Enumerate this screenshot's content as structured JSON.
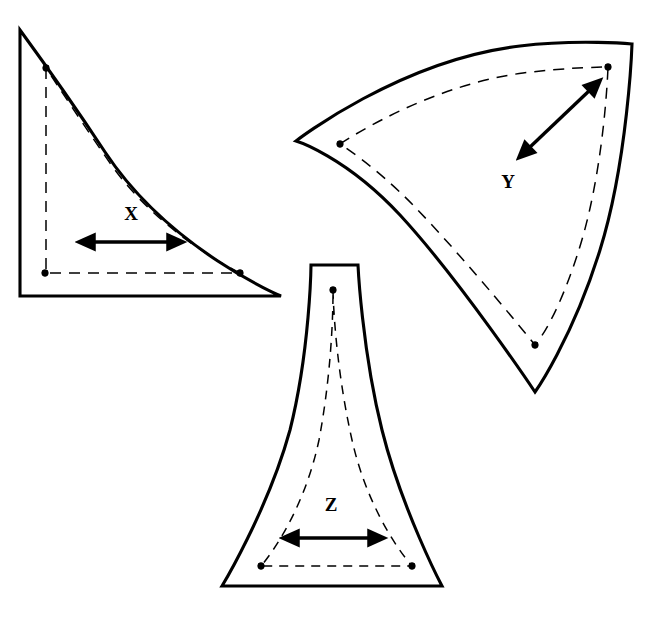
{
  "diagram": {
    "background_color": "#ffffff",
    "line_color": "#000000",
    "width": 650,
    "height": 618
  },
  "pieces": [
    {
      "id": "piece-x",
      "label": "X",
      "label_x": 131,
      "label_y": 220,
      "description": "quarter-round triangular panel with curved hypotenuse",
      "outline_path": "M 20 30 L 20 296 L 281 296 C 281 296 170 250 105 152 C 66 93 20 30 20 30 Z",
      "seam_path": "M 46 68 L 46 273 L 240 273 C 240 273 160 235 110 163 C 76 114 46 68 46 68 Z",
      "notches": [
        {
          "name": "notch-top-left",
          "x": 46,
          "y": 68
        },
        {
          "name": "notch-bottom-left",
          "x": 45,
          "y": 273
        },
        {
          "name": "notch-bottom-right",
          "x": 240,
          "y": 273
        }
      ],
      "grain_arrow": {
        "name": "grain-arrow-x",
        "orientation": "horizontal",
        "x1": 93,
        "y1": 242,
        "x2": 169,
        "y2": 242
      }
    },
    {
      "id": "piece-y",
      "label": "Y",
      "label_x": 508,
      "label_y": 188,
      "description": "curved fan-shaped panel, concave left and right edges, convex top edge",
      "outline_path": "M 296 141 C 296 141 400 60 520 46 C 578 39 632 44 632 44 C 632 44 628 160 600 250 C 572 340 535 392 535 392 C 535 392 460 280 400 215 C 345 156 296 141 296 141 Z",
      "seam_path": "M 340 144 C 340 144 425 86 523 73 C 570 67 608 67 608 67 C 608 67 605 163 581 243 C 557 322 535 345 535 345 C 535 345 468 262 414 206 C 375 166 340 144 340 144 Z",
      "notches": [
        {
          "name": "notch-left",
          "x": 340,
          "y": 144
        },
        {
          "name": "notch-top-right",
          "x": 608,
          "y": 67
        },
        {
          "name": "notch-bottom",
          "x": 535,
          "y": 345
        }
      ],
      "grain_arrow": {
        "name": "grain-arrow-y",
        "orientation": "diagonal",
        "x1": 529,
        "y1": 148,
        "x2": 590,
        "y2": 90
      }
    },
    {
      "id": "piece-z",
      "label": "Z",
      "label_x": 331,
      "label_y": 511,
      "description": "trumpet or funnel shaped panel, narrow at top flaring to a wide base",
      "outline_path": "M 311 265 L 358 265 C 358 265 362 350 382 430 C 402 510 442 586 442 586 L 222 586 C 222 586 268 510 290 430 C 310 350 311 265 311 265 Z",
      "seam_path": "M 333 290 C 333 290 334 360 352 440 C 370 520 412 566 412 566 L 261 566 C 261 566 302 520 319 440 C 334 360 333 290 333 290 Z",
      "notches": [
        {
          "name": "notch-top",
          "x": 333,
          "y": 290
        },
        {
          "name": "notch-bottom-left",
          "x": 261,
          "y": 566
        },
        {
          "name": "notch-bottom-right",
          "x": 412,
          "y": 566
        }
      ],
      "grain_arrow": {
        "name": "grain-arrow-z",
        "orientation": "horizontal",
        "x1": 297,
        "y1": 538,
        "x2": 370,
        "y2": 538
      }
    }
  ]
}
